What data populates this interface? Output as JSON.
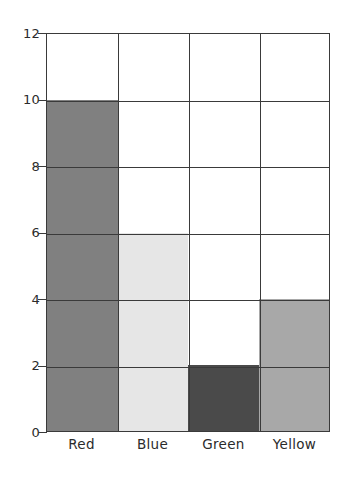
{
  "chart_data": {
    "type": "bar",
    "title": "",
    "xlabel": "",
    "ylabel": "",
    "categories": [
      "Red",
      "Blue",
      "Green",
      "Yellow"
    ],
    "values": [
      10,
      6,
      2,
      4
    ],
    "series": [
      {
        "name": "",
        "values": [
          10,
          6,
          2,
          4
        ]
      }
    ],
    "bar_colors": [
      "#808080",
      "#E6E6E6",
      "#4A4A4A",
      "#A8A8A8"
    ],
    "ylim": [
      0,
      12
    ],
    "y_ticks": [
      0,
      2,
      4,
      6,
      8,
      10,
      12
    ],
    "y_tick_labels": [
      "0",
      "2",
      "4",
      "6",
      "8",
      "10",
      "12"
    ],
    "grid": true,
    "grid_orientation": "both",
    "grid_on_top": true,
    "legend": false,
    "legend_position": "none",
    "axis_color": "#3A3A3A",
    "background_color": "#FFFFFF",
    "points": [
      {
        "category": "Red",
        "value": 10,
        "color": "#808080"
      },
      {
        "category": "Blue",
        "value": 6,
        "color": "#E6E6E6"
      },
      {
        "category": "Green",
        "value": 2,
        "color": "#4A4A4A"
      },
      {
        "category": "Yellow",
        "value": 4,
        "color": "#A8A8A8"
      }
    ]
  }
}
